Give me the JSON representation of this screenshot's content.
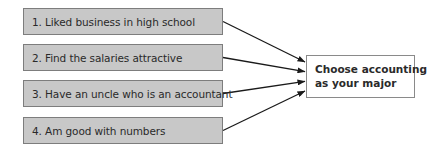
{
  "diagram": {
    "type": "cause-effect",
    "causes": [
      {
        "label": "1. Liked business in high school"
      },
      {
        "label": "2. Find the salaries attractive"
      },
      {
        "label": "3. Have an uncle who is an accountant"
      },
      {
        "label": "4. Am good with numbers"
      }
    ],
    "effect": {
      "lines": [
        "Choose accounting",
        "as your major"
      ]
    },
    "edges": [
      {
        "from": 0,
        "to": "effect"
      },
      {
        "from": 1,
        "to": "effect"
      },
      {
        "from": 2,
        "to": "effect"
      },
      {
        "from": 3,
        "to": "effect"
      }
    ],
    "colors": {
      "cause_fill": "#c8c8c8",
      "cause_border": "#7d7d7d",
      "effect_fill": "#ffffff",
      "effect_border": "#8a8a8a",
      "arrow": "#1a1a1a",
      "text": "#2a2a2a"
    }
  }
}
